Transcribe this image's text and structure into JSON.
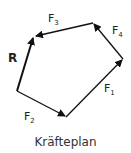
{
  "diagram": {
    "caption": "Kräfteplan",
    "vectors": [
      {
        "name": "F1",
        "label": "F",
        "sub": "1"
      },
      {
        "name": "F2",
        "label": "F",
        "sub": "2"
      },
      {
        "name": "F3",
        "label": "F",
        "sub": "3"
      },
      {
        "name": "F4",
        "label": "F",
        "sub": "4"
      },
      {
        "name": "R",
        "label": "R",
        "sub": ""
      }
    ],
    "colors": {
      "line": "#111111",
      "text": "#333333"
    }
  }
}
